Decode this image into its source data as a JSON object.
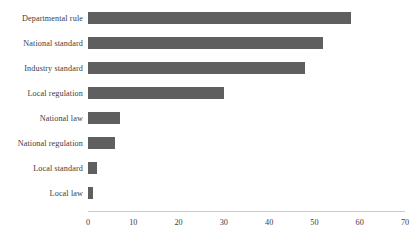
{
  "chart_data": {
    "type": "bar",
    "orientation": "horizontal",
    "title": "",
    "subtitle": "",
    "xlabel": "",
    "ylabel": "",
    "categories": [
      "Departmental rule",
      "National standard",
      "Industry standard",
      "Local regulation",
      "National law",
      "National regulation",
      "Local  standard",
      "Local law"
    ],
    "values": [
      58,
      52,
      48,
      30,
      7,
      6,
      2,
      1
    ],
    "xlim": [
      0,
      70
    ],
    "xticks": [
      0,
      10,
      20,
      30,
      40,
      50,
      60,
      70
    ],
    "xtick_labels": [
      "0",
      "10",
      "20",
      "30",
      "40",
      "50",
      "60",
      "70"
    ],
    "grid": false,
    "legend": null,
    "bar_color": "#5f5f5f",
    "axis_color": "#c9c9c9",
    "text_color": "#3c3c3c"
  }
}
